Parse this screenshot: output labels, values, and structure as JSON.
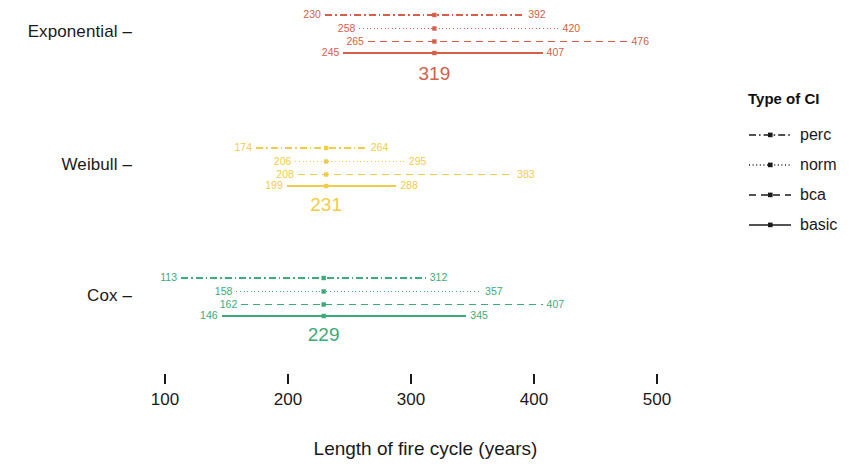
{
  "chart_data": {
    "type": "scatter",
    "title": "",
    "xlabel": "Length of fire cycle (years)",
    "ylabel": "",
    "xlim": [
      85,
      560
    ],
    "xticks": [
      100,
      200,
      300,
      400,
      500
    ],
    "xtick_labels": [
      "100",
      "200",
      "300",
      "400",
      "500"
    ],
    "categories": [
      "Exponential",
      "Weibull",
      "Cox"
    ],
    "grid": false,
    "legend_position": "right",
    "legend_title": "Type of CI",
    "ci_types": [
      "perc",
      "norm",
      "bca",
      "basic"
    ],
    "groups": [
      {
        "name": "Exponential",
        "color": "#d4604a",
        "estimate": 319,
        "estimate_label": "319",
        "intervals": [
          {
            "type": "perc",
            "lower": 230,
            "upper": 392,
            "lower_label": "230",
            "upper_label": "392",
            "style": "dashdot"
          },
          {
            "type": "norm",
            "lower": 258,
            "upper": 420,
            "lower_label": "258",
            "upper_label": "420",
            "style": "dotted"
          },
          {
            "type": "bca",
            "lower": 265,
            "upper": 476,
            "lower_label": "265",
            "upper_label": "476",
            "style": "dashed"
          },
          {
            "type": "basic",
            "lower": 245,
            "upper": 407,
            "lower_label": "245",
            "upper_label": "407",
            "style": "solid"
          }
        ]
      },
      {
        "name": "Weibull",
        "color": "#f0cc4a",
        "estimate": 231,
        "estimate_label": "231",
        "intervals": [
          {
            "type": "perc",
            "lower": 174,
            "upper": 264,
            "lower_label": "174",
            "upper_label": "264",
            "style": "dashdot"
          },
          {
            "type": "norm",
            "lower": 206,
            "upper": 295,
            "lower_label": "206",
            "upper_label": "295",
            "style": "dotted"
          },
          {
            "type": "bca",
            "lower": 208,
            "upper": 383,
            "lower_label": "208",
            "upper_label": "383",
            "style": "dashed"
          },
          {
            "type": "basic",
            "lower": 199,
            "upper": 288,
            "lower_label": "199",
            "upper_label": "288",
            "style": "solid"
          }
        ]
      },
      {
        "name": "Cox",
        "color": "#3daa7a",
        "estimate": 229,
        "estimate_label": "229",
        "intervals": [
          {
            "type": "perc",
            "lower": 113,
            "upper": 312,
            "lower_label": "113",
            "upper_label": "312",
            "style": "dashdot"
          },
          {
            "type": "norm",
            "lower": 158,
            "upper": 357,
            "lower_label": "158",
            "upper_label": "357",
            "style": "dotted"
          },
          {
            "type": "bca",
            "lower": 162,
            "upper": 407,
            "lower_label": "162",
            "upper_label": "407",
            "style": "dashed"
          },
          {
            "type": "basic",
            "lower": 146,
            "upper": 345,
            "lower_label": "146",
            "upper_label": "345",
            "style": "solid"
          }
        ]
      }
    ]
  },
  "axis": {
    "x_title": "Length of fire cycle (years)",
    "ticks": [
      "100",
      "200",
      "300",
      "400",
      "500"
    ],
    "group_labels": [
      "Exponential",
      "Weibull",
      "Cox"
    ]
  },
  "legend": {
    "title": "Type of CI",
    "items": [
      {
        "label": "perc",
        "style": "dashdot"
      },
      {
        "label": "norm",
        "style": "dotted"
      },
      {
        "label": "bca",
        "style": "dashed"
      },
      {
        "label": "basic",
        "style": "solid"
      }
    ]
  }
}
